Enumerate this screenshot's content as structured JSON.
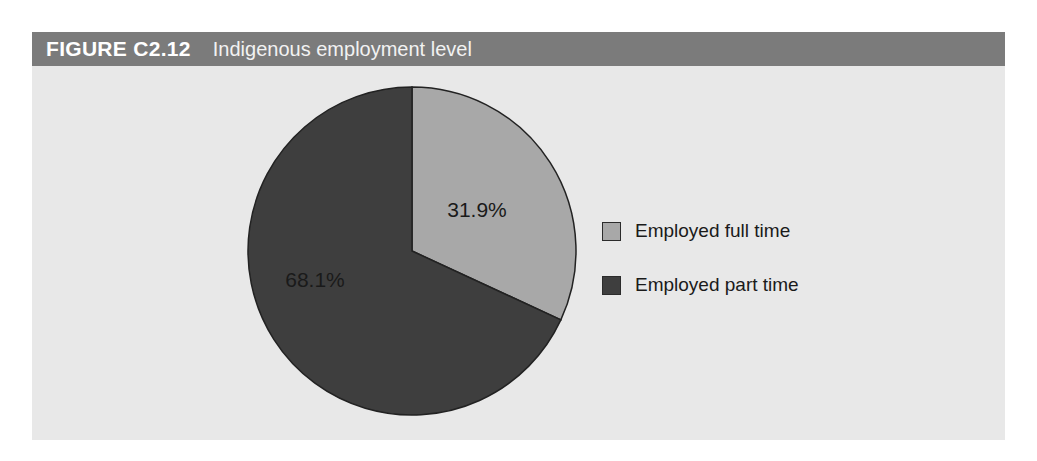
{
  "figure": {
    "number": "FIGURE C2.12",
    "title": "Indigenous employment level"
  },
  "colors": {
    "titlebar_background": "#7b7b7b",
    "titlebar_text": "#ffffff",
    "panel_background": "#e8e8e8",
    "slice_full_time": "#a8a8a8",
    "slice_part_time": "#3e3e3e",
    "slice_outline": "#222222",
    "label_text": "#1a1a1a"
  },
  "legend": {
    "position": "right",
    "items": [
      {
        "label": "Employed full time",
        "swatch_color": "#a8a8a8",
        "swatch_icon": "legend-swatch-icon"
      },
      {
        "label": "Employed part time",
        "swatch_color": "#3e3e3e",
        "swatch_icon": "legend-swatch-icon"
      }
    ]
  },
  "chart_data": {
    "type": "pie",
    "title": "Indigenous employment level",
    "subtitle": "",
    "xlabel": "",
    "ylabel": "",
    "start_angle_deg": 0,
    "direction": "clockwise",
    "grid": false,
    "legend_position": "right",
    "categories": [
      "Employed full time",
      "Employed part time"
    ],
    "values": [
      31.9,
      68.1
    ],
    "value_unit": "%",
    "data_labels": [
      "31.9%",
      "68.1%"
    ],
    "slices": [
      {
        "name": "Employed full time",
        "value": 31.9,
        "label": "31.9%",
        "color": "#a8a8a8",
        "start_angle_deg": 0,
        "end_angle_deg": 114.84
      },
      {
        "name": "Employed part time",
        "value": 68.1,
        "label": "68.1%",
        "color": "#3e3e3e",
        "start_angle_deg": 114.84,
        "end_angle_deg": 360
      }
    ]
  }
}
